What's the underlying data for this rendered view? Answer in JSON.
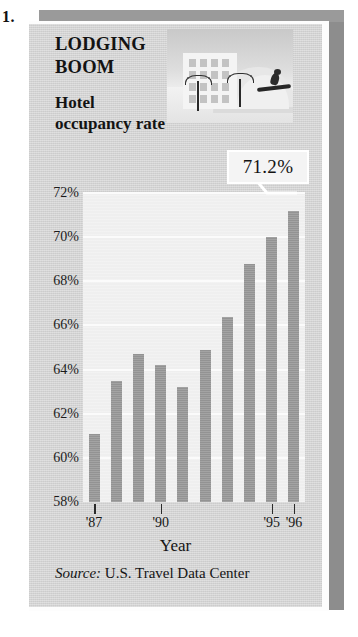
{
  "item_number": "1.",
  "figure": {
    "headline": "LODGING BOOM",
    "subhead": "Hotel occupancy rate",
    "callout_value": "71.2%",
    "source_label": "Source:",
    "source_text": " U.S. Travel Data Center",
    "illustration_name": "hotel-resort-illustration"
  },
  "chart_data": {
    "type": "bar",
    "title": "LODGING BOOM",
    "subtitle": "Hotel occupancy rate",
    "xlabel": "Year",
    "ylabel": "",
    "ylim": [
      58,
      72
    ],
    "ytick_labels": [
      "72%",
      "70%",
      "68%",
      "66%",
      "64%",
      "62%",
      "60%",
      "58%"
    ],
    "ytick_values": [
      72,
      70,
      68,
      66,
      64,
      62,
      60,
      58
    ],
    "grid": true,
    "legend": "none",
    "categories": [
      "'87",
      "'88",
      "'89",
      "'90",
      "'91",
      "'92",
      "'93",
      "'94",
      "'95",
      "'96"
    ],
    "xtick_labels": [
      "'87",
      "'90",
      "'95",
      "'96"
    ],
    "xtick_indices": [
      0,
      3,
      8,
      9
    ],
    "values": [
      61.1,
      63.5,
      64.7,
      64.2,
      63.2,
      64.9,
      66.4,
      68.8,
      70.0,
      71.2
    ],
    "annotation": "71.2%",
    "annotation_index": 9,
    "bar_color": "#999999",
    "plot_bg": "#efefef",
    "source": "Source: U.S. Travel Data Center"
  }
}
